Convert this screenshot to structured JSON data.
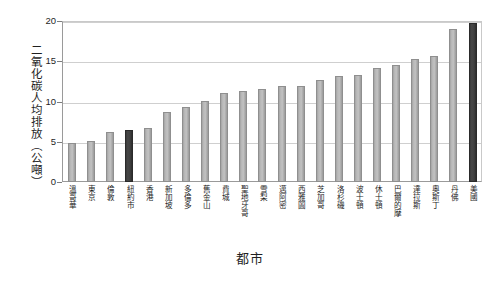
{
  "chart_data": {
    "type": "bar",
    "title": "",
    "xlabel": "都市",
    "ylabel": "二氧化碳人均排放（公噸）",
    "ylim": [
      0,
      20
    ],
    "yticks": [
      0,
      5,
      10,
      15,
      20
    ],
    "ytick_labels": [
      "0",
      "5",
      "10",
      "15",
      "20"
    ],
    "grid": true,
    "legend": "none",
    "categories": [
      "溫哥華",
      "東京",
      "倫敦",
      "紐約市",
      "香港",
      "新加坡",
      "多倫多",
      "舊金山",
      "費城",
      "聖地牙哥",
      "雪梨",
      "邁阿密",
      "西雅圖",
      "芝加哥",
      "洛杉磯",
      "波士頓",
      "休士頓",
      "巴爾的摩",
      "達拉斯",
      "奧斯丁",
      "丹佛",
      "美國"
    ],
    "values": [
      4.9,
      5.1,
      6.2,
      6.4,
      6.7,
      8.7,
      9.3,
      10.1,
      11.0,
      11.3,
      11.6,
      11.9,
      11.9,
      12.7,
      13.2,
      13.3,
      14.2,
      14.5,
      15.3,
      15.7,
      19.0,
      19.8
    ],
    "highlight_indices": [
      3,
      21
    ],
    "colors": {
      "bar": "#b6b6b6",
      "bar_border": "#8f8f8f",
      "highlight": "#3a3a3a",
      "highlight_border": "#2a2a2a",
      "grid": "#cfcfcf",
      "axis": "#9a9a9a",
      "text": "#1f1f1f",
      "background": "#ffffff"
    }
  }
}
